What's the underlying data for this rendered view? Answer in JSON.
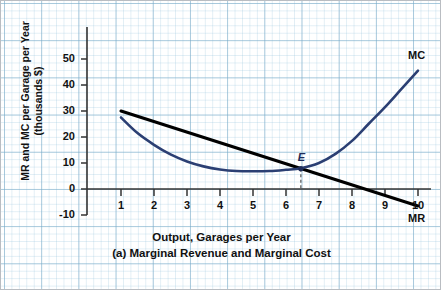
{
  "figure": {
    "caption_line1": "Output, Garages per Year",
    "caption_line2": "(a) Marginal Revenue and Marginal Cost",
    "y_axis_label_line1": "MR and MC per Garage per Year",
    "y_axis_label_line2": "(thousands $)"
  },
  "labels": {
    "mc": "MC",
    "mr": "MR",
    "equilibrium": "E"
  },
  "colors": {
    "mc_curve": "#2b3f73",
    "mr_line": "#000000",
    "grid_major": "#78aac8",
    "grid_minor": "#96c3dc",
    "axis": "#333333",
    "frame": "#b9bdc2"
  },
  "chart_data": {
    "type": "line",
    "title": "(a) Marginal Revenue and Marginal Cost",
    "xlabel": "Output, Garages per Year",
    "ylabel": "MR and MC per Garage per Year (thousands $)",
    "xlim": [
      0,
      10.4
    ],
    "ylim": [
      -10,
      50
    ],
    "xticks": [
      1,
      2,
      3,
      4,
      5,
      6,
      7,
      8,
      9,
      10
    ],
    "yticks": [
      -10,
      0,
      10,
      20,
      30,
      40,
      50
    ],
    "grid": true,
    "legend": "inline-curve-labels",
    "series": [
      {
        "name": "MR",
        "label": "MR",
        "color": "#000000",
        "type": "line",
        "x": [
          1,
          10
        ],
        "y": [
          30,
          -6.5
        ],
        "note": "Marginal revenue, straight downward-sloping line"
      },
      {
        "name": "MC",
        "label": "MC",
        "color": "#2b3f73",
        "type": "curve",
        "x": [
          1,
          1.5,
          2,
          2.5,
          3,
          3.5,
          4,
          4.5,
          5,
          5.5,
          6,
          6.45,
          7,
          7.5,
          8,
          8.5,
          9,
          9.5,
          10
        ],
        "y": [
          27.5,
          21.5,
          17.0,
          13.3,
          10.6,
          8.7,
          7.5,
          6.9,
          6.8,
          6.9,
          7.4,
          8.0,
          10.0,
          13.5,
          18.5,
          25.0,
          31.5,
          38.5,
          45.5
        ],
        "note": "Marginal cost, U-shaped curve"
      }
    ],
    "annotations": [
      {
        "label": "E",
        "kind": "equilibrium-point",
        "x": 6.45,
        "y": 7.8,
        "dropline": {
          "from_y": 7.8,
          "to_y": 0,
          "style": "dashed"
        }
      }
    ]
  },
  "axis_ticks": {
    "y": [
      {
        "value": "50",
        "py": 32
      },
      {
        "value": "40",
        "py": 58
      },
      {
        "value": "30",
        "py": 84
      },
      {
        "value": "20",
        "py": 110
      },
      {
        "value": "10",
        "py": 136
      },
      {
        "value": "0",
        "py": 162
      },
      {
        "value": "-10",
        "py": 188
      }
    ],
    "x": [
      {
        "value": "1",
        "px": 120
      },
      {
        "value": "2",
        "px": 153
      },
      {
        "value": "3",
        "px": 186
      },
      {
        "value": "4",
        "px": 219
      },
      {
        "value": "5",
        "px": 252
      },
      {
        "value": "6",
        "px": 285
      },
      {
        "value": "7",
        "px": 318
      },
      {
        "value": "8",
        "px": 351
      },
      {
        "value": "9",
        "px": 384
      },
      {
        "value": "10",
        "px": 417
      }
    ]
  }
}
